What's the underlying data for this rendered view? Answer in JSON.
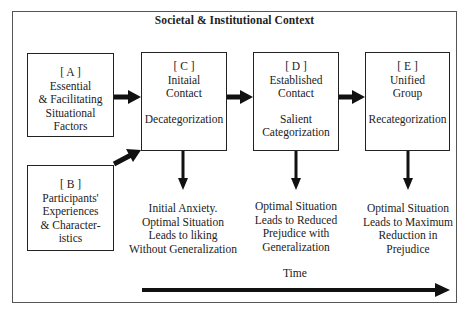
{
  "diagram": {
    "title": "Societal & Institutional Context",
    "boxes": {
      "a": {
        "id": "[ A ]",
        "lines": [
          "Essential",
          "& Facilitating",
          "Situational",
          "Factors"
        ]
      },
      "b": {
        "id": "[ B ]",
        "lines": [
          "Participants'",
          "Experiences",
          "& Character-",
          "istics"
        ]
      },
      "c": {
        "id": "[ C ]",
        "lines": [
          "Initaial",
          "Contact"
        ],
        "process": [
          "Decategorization"
        ]
      },
      "d": {
        "id": "[ D ]",
        "lines": [
          "Established",
          "Contact"
        ],
        "process": [
          "Salient",
          "Categorization"
        ]
      },
      "e": {
        "id": "[ E ]",
        "lines": [
          "Unified",
          "Group"
        ],
        "process": [
          "Recategorization"
        ]
      }
    },
    "outcomes": {
      "c": [
        "Initial Anxiety.",
        "Optimal  Situation",
        "Leads to liking",
        "Without Generalization"
      ],
      "d": [
        "Optimal Situation",
        "Leads to Reduced",
        "Prejudice with",
        "Generalization"
      ],
      "e": [
        "Optimal Situation",
        "Leads to Maximum",
        "Reduction in",
        "Prejudice"
      ]
    },
    "time_label": "Time",
    "colors": {
      "line": "#111111",
      "frame": "#555555",
      "background": "#ffffff"
    }
  }
}
